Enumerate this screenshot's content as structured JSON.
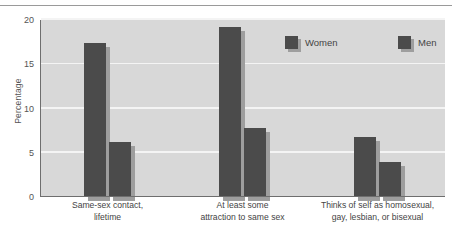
{
  "chart_data": {
    "type": "bar",
    "title": "",
    "subtitle": "",
    "xlabel": "",
    "ylabel": "Percentage",
    "ylim": [
      0,
      20
    ],
    "yticks": [
      0,
      5,
      10,
      15,
      20
    ],
    "ytick_labels": [
      "0",
      "5",
      "10",
      "15",
      "20"
    ],
    "grid": true,
    "grid_axis": "y",
    "legend_position": "top-right-inside",
    "categories": [
      "Same-sex contact, lifetime",
      "At least some attraction to same sex",
      "Thinks of self as homosexual, gay, lesbian, or bisexual"
    ],
    "category_lines": [
      [
        "Same-sex contact,",
        "lifetime"
      ],
      [
        "At least some",
        "attraction to same sex"
      ],
      [
        "Thinks of self as homosexual,",
        "gay, lesbian, or bisexual"
      ]
    ],
    "series": [
      {
        "name": "Women",
        "values": [
          17.4,
          19.2,
          6.8
        ],
        "color": "#4b4b4b"
      },
      {
        "name": "Men",
        "values": [
          6.2,
          7.8,
          4.0
        ],
        "color": "#4b4b4b"
      }
    ]
  },
  "legend": {
    "items": [
      {
        "label": "Women"
      },
      {
        "label": "Men"
      }
    ]
  },
  "axes": {
    "y_title": "Percentage"
  },
  "colors": {
    "bar": "#4b4b4b",
    "bar_shadow": "#9e9e9e",
    "plot_background": "#d8d8d8",
    "gridline": "#f4f4f4",
    "axis_line": "#6e6e6e",
    "text": "#444444",
    "page_background": "#ffffff",
    "top_rule": "#9a9a9a"
  }
}
